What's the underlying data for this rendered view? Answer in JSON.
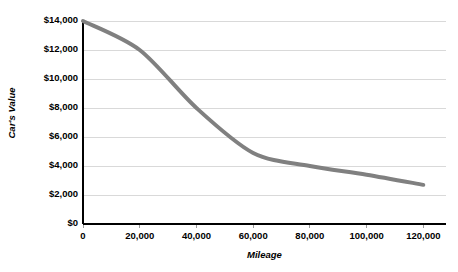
{
  "chart_data": {
    "type": "line",
    "title": "",
    "xlabel": "Mileage",
    "ylabel": "Car's Value",
    "x": [
      0,
      20000,
      40000,
      60000,
      80000,
      100000,
      120000
    ],
    "values": [
      14000,
      12000,
      8000,
      4900,
      4000,
      3400,
      2700
    ],
    "series": [
      {
        "name": "Car's Value",
        "values": [
          14000,
          12000,
          8000,
          4900,
          4000,
          3400,
          2700
        ]
      }
    ],
    "xlim": [
      0,
      128000
    ],
    "ylim": [
      0,
      14000
    ],
    "x_tick_labels": [
      "0",
      "20,000",
      "40,000",
      "60,000",
      "80,000",
      "100,000",
      "120,000"
    ],
    "x_tick_values": [
      0,
      20000,
      40000,
      60000,
      80000,
      100000,
      120000
    ],
    "y_tick_labels": [
      "$0",
      "$2,000",
      "$4,000",
      "$6,000",
      "$8,000",
      "$10,000",
      "$12,000",
      "$14,000"
    ],
    "y_tick_values": [
      0,
      2000,
      4000,
      6000,
      8000,
      10000,
      12000,
      14000
    ],
    "grid": "horizontal",
    "legend": "none",
    "line_color": "#808080",
    "grid_color": "#d9d9d9",
    "axis_color": "#000000",
    "background_color": "#ffffff",
    "line_width": 4,
    "smoothing": "spline"
  }
}
